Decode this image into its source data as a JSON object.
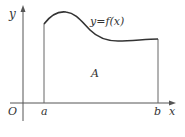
{
  "diagram": {
    "type": "area-under-curve",
    "axes": {
      "x_label": "x",
      "y_label": "y",
      "origin_label": "O"
    },
    "curve": {
      "label": "y=f(x)"
    },
    "bounds": {
      "left_label": "a",
      "right_label": "b"
    },
    "region": {
      "label": "A"
    },
    "colors": {
      "axis": "#555555",
      "curve": "#333333",
      "bound_lines": "#666666",
      "text": "#333333"
    }
  }
}
